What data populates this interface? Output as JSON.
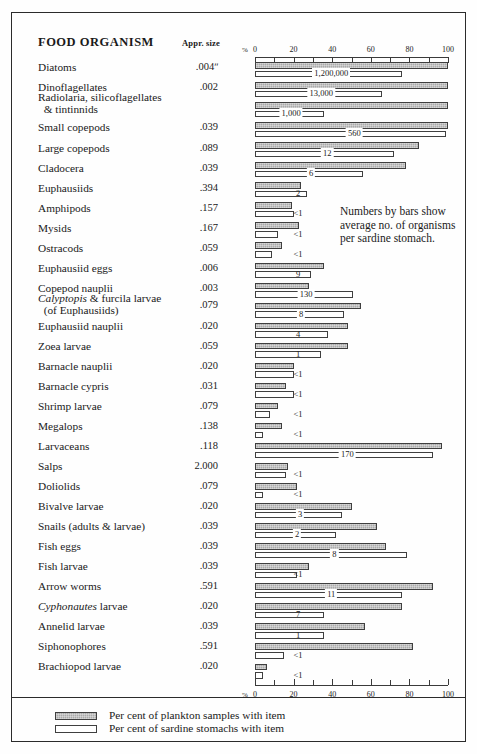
{
  "table": {
    "header_organism": "FOOD ORGANISM",
    "header_size": "Appr. size"
  },
  "annotation": "Numbers by bars show average no. of organisms per sardine stomach.",
  "legend": {
    "items": [
      {
        "swatch": "plankton",
        "label": "Per cent of plankton samples with item"
      },
      {
        "swatch": "sardine",
        "label": "Per cent of sardine stomachs with item"
      }
    ]
  },
  "axis": {
    "percent_symbol": "%",
    "tick_labels": [
      "0",
      "20",
      "40",
      "60",
      "80",
      "100"
    ],
    "tick_values": [
      0,
      20,
      40,
      60,
      80,
      100
    ],
    "minor_step": 10,
    "min": 0,
    "max": 100
  },
  "colors": {
    "plankton_bar": "#aaaaaa",
    "sardine_bar": "#ffffff",
    "bar_outline": "#3f3f3f",
    "frame": "#2b2b2b",
    "text": "#1a1a1a"
  },
  "chart_data": {
    "type": "bar",
    "title": "",
    "xlabel": "%",
    "ylabel": "",
    "xlim": [
      0,
      100
    ],
    "grid": false,
    "legend_position": "bottom",
    "orientation": "horizontal",
    "series": [
      {
        "name": "Per cent of plankton samples with item",
        "key": "plankton"
      },
      {
        "name": "Per cent of sardine stomachs with item",
        "key": "sardine"
      }
    ],
    "rows": [
      {
        "organism": "Diatoms",
        "size": ".004ʺ",
        "plankton": 100,
        "sardine": 76,
        "number": "1,200,000",
        "number_style": "leader"
      },
      {
        "organism": "Dinoflagellates",
        "size": ".002",
        "plankton": 100,
        "sardine": 66,
        "number": "13,000",
        "number_style": "leader"
      },
      {
        "organism": "Radiolaria, silicoflagellates & tintinnids",
        "size": "",
        "plankton": 100,
        "sardine": 36,
        "number": "1,000",
        "number_style": "leader"
      },
      {
        "organism": "Small copepods",
        "size": ".039",
        "plankton": 100,
        "sardine": 99,
        "number": "560",
        "number_style": "leader"
      },
      {
        "organism": "Large copepods",
        "size": ".089",
        "plankton": 85,
        "sardine": 72,
        "number": "12",
        "number_style": "leader"
      },
      {
        "organism": "Cladocera",
        "size": ".039",
        "plankton": 78,
        "sardine": 56,
        "number": "6",
        "number_style": "leader"
      },
      {
        "organism": "Euphausiids",
        "size": ".394",
        "plankton": 24,
        "sardine": 27,
        "number": "2",
        "number_style": "plain"
      },
      {
        "organism": "Amphipods",
        "size": ".157",
        "plankton": 19,
        "sardine": 20,
        "number": "<1",
        "number_style": "plain"
      },
      {
        "organism": "Mysids",
        "size": ".167",
        "plankton": 23,
        "sardine": 12,
        "number": "<1",
        "number_style": "plain"
      },
      {
        "organism": "Ostracods",
        "size": ".059",
        "plankton": 14,
        "sardine": 9,
        "number": "<1",
        "number_style": "plain"
      },
      {
        "organism": "Euphausiid eggs",
        "size": ".006",
        "plankton": 36,
        "sardine": 29,
        "number": "9",
        "number_style": "plain"
      },
      {
        "organism": "Copepod nauplii",
        "size": ".003",
        "plankton": 28,
        "sardine": 51,
        "number": "130",
        "number_style": "leader"
      },
      {
        "organism": "Calyptopis & furcila larvae (of Euphausiids)",
        "size": ".079",
        "plankton": 55,
        "sardine": 46,
        "number": "8",
        "number_style": "leader"
      },
      {
        "organism": "Euphausiid nauplii",
        "size": ".020",
        "plankton": 48,
        "sardine": 38,
        "number": "4",
        "number_style": "plain"
      },
      {
        "organism": "Zoea larvae",
        "size": ".059",
        "plankton": 48,
        "sardine": 34,
        "number": "1",
        "number_style": "plain"
      },
      {
        "organism": "Barnacle nauplii",
        "size": ".020",
        "plankton": 20,
        "sardine": 20,
        "number": "<1",
        "number_style": "plain"
      },
      {
        "organism": "Barnacle cypris",
        "size": ".031",
        "plankton": 16,
        "sardine": 20,
        "number": "<1",
        "number_style": "plain"
      },
      {
        "organism": "Shrimp larvae",
        "size": ".079",
        "plankton": 12,
        "sardine": 8,
        "number": "<1",
        "number_style": "plain"
      },
      {
        "organism": "Megalops",
        "size": ".138",
        "plankton": 14,
        "sardine": 4,
        "number": "<1",
        "number_style": "plain"
      },
      {
        "organism": "Larvaceans",
        "size": ".118",
        "plankton": 97,
        "sardine": 92,
        "number": "170",
        "number_style": "leader"
      },
      {
        "organism": "Salps",
        "size": "2.000",
        "plankton": 17,
        "sardine": 16,
        "number": "<1",
        "number_style": "plain"
      },
      {
        "organism": "Doliolids",
        "size": ".079",
        "plankton": 22,
        "sardine": 4,
        "number": "<1",
        "number_style": "plain"
      },
      {
        "organism": "Bivalve larvae",
        "size": ".020",
        "plankton": 50,
        "sardine": 45,
        "number": "3",
        "number_style": "leader"
      },
      {
        "organism": "Snails (adults & larvae)",
        "size": ".039",
        "plankton": 63,
        "sardine": 42,
        "number": "2",
        "number_style": "leader"
      },
      {
        "organism": "Fish eggs",
        "size": ".039",
        "plankton": 68,
        "sardine": 79,
        "number": "8",
        "number_style": "leader"
      },
      {
        "organism": "Fish larvae",
        "size": ".039",
        "plankton": 28,
        "sardine": 22,
        "number": "<1",
        "number_style": "plain"
      },
      {
        "organism": "Arrow worms",
        "size": ".591",
        "plankton": 92,
        "sardine": 76,
        "number": "11",
        "number_style": "leader"
      },
      {
        "organism": "Cyphonautes larvae",
        "size": ".020",
        "plankton": 76,
        "sardine": 36,
        "number": "7",
        "number_style": "plain"
      },
      {
        "organism": "Annelid larvae",
        "size": ".039",
        "plankton": 57,
        "sardine": 36,
        "number": "1",
        "number_style": "plain"
      },
      {
        "organism": "Siphonophores",
        "size": ".591",
        "plankton": 82,
        "sardine": 15,
        "number": "<1",
        "number_style": "plain"
      },
      {
        "organism": "Brachiopod larvae",
        "size": ".020",
        "plankton": 6,
        "sardine": 4,
        "number": "<1",
        "number_style": "plain"
      }
    ]
  }
}
